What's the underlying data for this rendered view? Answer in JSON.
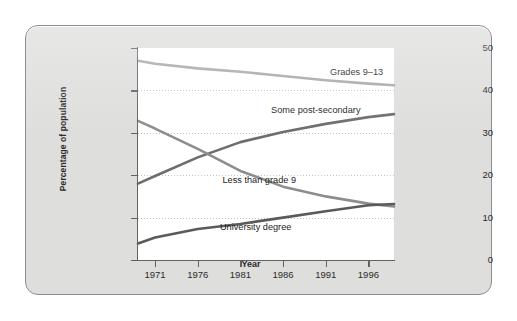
{
  "chart_data": {
    "type": "line",
    "title": "",
    "subtitle": "",
    "xlabel": "Year",
    "ylabel": "Percentage of population",
    "xlim": [
      1969,
      1999
    ],
    "ylim": [
      0,
      50
    ],
    "grid": true,
    "legend_position": "inline-labels",
    "xticks": [
      "1971",
      "1976",
      "1981",
      "1986",
      "1991",
      "1996"
    ],
    "xtick_values": [
      1971,
      1976,
      1981,
      1986,
      1991,
      1996
    ],
    "yticks": [
      "0",
      "10",
      "20",
      "30",
      "40",
      "50"
    ],
    "ytick_values": [
      0,
      10,
      20,
      30,
      40,
      50
    ],
    "x": [
      1969,
      1971,
      1976,
      1981,
      1986,
      1991,
      1996,
      1999
    ],
    "series": [
      {
        "name": "Grades 9-13",
        "label": "Grades 9–13",
        "color": "#a8a8a8",
        "values": [
          47.0,
          46.3,
          45.2,
          44.4,
          43.4,
          42.4,
          41.6,
          41.2
        ],
        "label_x_pct": 75,
        "label_y_pct": 9
      },
      {
        "name": "Some post-secondary",
        "label": "Some post-secondary",
        "color": "#6d6d6d",
        "values": [
          18.0,
          19.8,
          24.2,
          27.8,
          30.2,
          32.1,
          33.7,
          34.4
        ],
        "label_x_pct": 52,
        "label_y_pct": 27
      },
      {
        "name": "Less than grade 9",
        "label": "Less than grade 9",
        "color": "#8d8d8d",
        "values": [
          32.8,
          31.0,
          26.2,
          21.0,
          17.3,
          15.0,
          13.3,
          12.6
        ],
        "label_x_pct": 33,
        "label_y_pct": 60
      },
      {
        "name": "University degree",
        "label": "University degree",
        "color": "#5a5a5a",
        "values": [
          3.9,
          5.3,
          7.3,
          8.5,
          10.0,
          11.5,
          12.9,
          13.2
        ],
        "label_x_pct": 32,
        "label_y_pct": 82
      }
    ]
  },
  "axes": {
    "y_title": "Percentage of population",
    "x_title": "Year"
  }
}
